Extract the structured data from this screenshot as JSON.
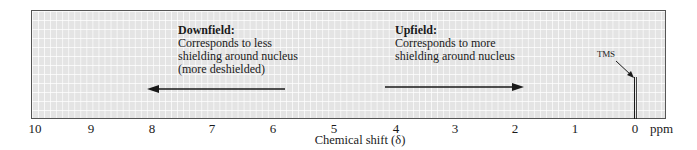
{
  "chart_data": {
    "type": "line",
    "title": "",
    "xlabel": "Chemical shift (δ)",
    "x_unit": "ppm",
    "xlim": [
      10,
      0
    ],
    "x_direction": "decreasing left-to-right",
    "ticks": [
      "10",
      "9",
      "8",
      "7",
      "6",
      "5",
      "4",
      "3",
      "2",
      "1",
      "0"
    ],
    "grid": true,
    "series": [
      {
        "name": "TMS",
        "type": "peak",
        "x": 0,
        "relative_height": 0.4
      }
    ],
    "annotations": [
      {
        "id": "downfield",
        "title": "Downfield:",
        "lines": [
          "Corresponds to less",
          "shielding around nucleus",
          "(more deshielded)"
        ],
        "arrow": {
          "from_ppm": 6.2,
          "to_ppm": 8.1,
          "direction": "left"
        }
      },
      {
        "id": "upfield",
        "title": "Upfield:",
        "lines": [
          "Corresponds to more",
          "shielding around nucleus"
        ],
        "arrow": {
          "from_ppm": 4.2,
          "to_ppm": 1.9,
          "direction": "right"
        }
      },
      {
        "id": "tms",
        "text": "TMS",
        "points_to_ppm": 0
      }
    ]
  },
  "labels": {
    "downfield_title": "Downfield:",
    "downfield_line1": "Corresponds to less",
    "downfield_line2": "shielding around nucleus",
    "downfield_line3": "(more deshielded)",
    "upfield_title": "Upfield:",
    "upfield_line1": "Corresponds to more",
    "upfield_line2": "shielding around nucleus",
    "tms": "TMS",
    "unit": "ppm",
    "xlabel": "Chemical shift (δ)"
  },
  "ticks": [
    {
      "label": "10",
      "x": 35
    },
    {
      "label": "9",
      "x": 91
    },
    {
      "label": "8",
      "x": 152
    },
    {
      "label": "7",
      "x": 212
    },
    {
      "label": "6",
      "x": 273
    },
    {
      "label": "5",
      "x": 334
    },
    {
      "label": "4",
      "x": 396
    },
    {
      "label": "3",
      "x": 455
    },
    {
      "label": "2",
      "x": 515
    },
    {
      "label": "1",
      "x": 575
    },
    {
      "label": "0",
      "x": 635
    }
  ],
  "colors": {
    "plot_fill": "#e4e4e4",
    "grid": "#ffffff",
    "ink": "#1a1a1a"
  }
}
